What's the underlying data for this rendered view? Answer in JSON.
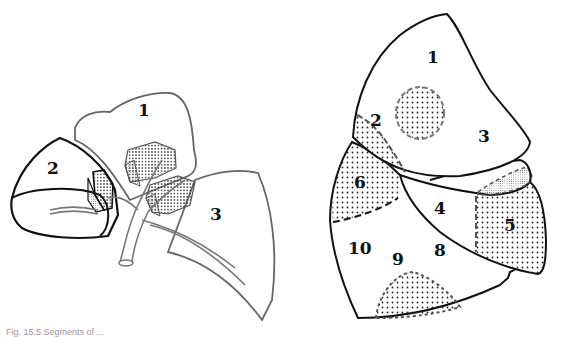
{
  "figure": {
    "caption": "Fig. 15.5   Segments of ...",
    "left_diagram": {
      "description": "Exploded view of upper lobe segments with bronchial tree",
      "segments": [
        {
          "id": "1",
          "label": "1"
        },
        {
          "id": "2",
          "label": "2"
        },
        {
          "id": "3",
          "label": "3"
        }
      ]
    },
    "right_diagram": {
      "description": "Lateral view of lung with numbered bronchopulmonary segments",
      "segments": [
        {
          "id": "1",
          "label": "1"
        },
        {
          "id": "2",
          "label": "2"
        },
        {
          "id": "3",
          "label": "3"
        },
        {
          "id": "4",
          "label": "4"
        },
        {
          "id": "5",
          "label": "5"
        },
        {
          "id": "6",
          "label": "6"
        },
        {
          "id": "8",
          "label": "8"
        },
        {
          "id": "9",
          "label": "9"
        },
        {
          "id": "10",
          "label": "10"
        }
      ]
    },
    "colors": {
      "outline": "#111111",
      "light_outline": "#777777",
      "stipple": "#222222"
    }
  }
}
